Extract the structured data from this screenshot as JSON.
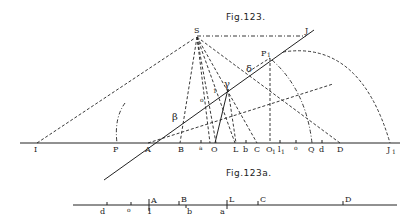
{
  "figures": [
    {
      "title": "Fig.123.",
      "points": {
        "S": "S",
        "J": "J",
        "P1": "P",
        "P1_sub": "1",
        "delta": "δ",
        "gamma": "γ",
        "beta": "β",
        "one": "1",
        "o": "o"
      },
      "baseline_labels": [
        {
          "id": "I",
          "text": "I",
          "x": 37
        },
        {
          "id": "P",
          "text": "P",
          "x": 117
        },
        {
          "id": "A",
          "text": "A",
          "x": 148
        },
        {
          "id": "B",
          "text": "B",
          "x": 182
        },
        {
          "id": "a",
          "text": "a",
          "x": 201
        },
        {
          "id": "O",
          "text": "O",
          "x": 215
        },
        {
          "id": "L",
          "text": "L",
          "x": 236
        },
        {
          "id": "b",
          "text": "b",
          "x": 246
        },
        {
          "id": "C",
          "text": "C",
          "x": 257
        },
        {
          "id": "O1",
          "text": "O",
          "sub": "1",
          "x": 270
        },
        {
          "id": "l1",
          "text": "l",
          "sub": "1",
          "x": 280
        },
        {
          "id": "o",
          "text": "o",
          "x": 296
        },
        {
          "id": "Q",
          "text": "Q",
          "x": 311
        },
        {
          "id": "d",
          "text": "d",
          "x": 322
        },
        {
          "id": "D",
          "text": "D",
          "x": 340
        },
        {
          "id": "J1",
          "text": "J",
          "sub": "1",
          "x": 390
        }
      ]
    },
    {
      "title": "Fig.123a.",
      "upper_labels": [
        {
          "id": "A",
          "text": "A",
          "x": 153
        },
        {
          "id": "B",
          "text": "B",
          "x": 183
        },
        {
          "id": "L",
          "text": "L",
          "x": 231
        },
        {
          "id": "C",
          "text": "C",
          "x": 262
        },
        {
          "id": "D",
          "text": "D",
          "x": 347
        }
      ],
      "lower_labels": [
        {
          "id": "d",
          "text": "d",
          "x": 102
        },
        {
          "id": "o",
          "text": "o",
          "x": 129
        },
        {
          "id": "1",
          "text": "1",
          "x": 150
        },
        {
          "id": "b",
          "text": "b",
          "x": 189
        },
        {
          "id": "a",
          "text": "a",
          "x": 222
        }
      ]
    }
  ]
}
